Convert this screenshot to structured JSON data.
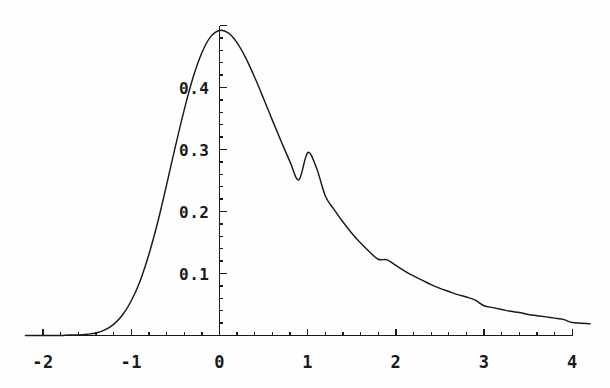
{
  "chart_data": {
    "type": "line",
    "title": "",
    "subtitle": "",
    "xlabel": "",
    "ylabel": "",
    "xlim": [
      -2.2,
      4.2
    ],
    "ylim": [
      0,
      0.54
    ],
    "grid": false,
    "legend": null,
    "annotations": [],
    "axis_style": "cross-axes-at-origin",
    "x_ticks_major": [
      -2,
      -1,
      0,
      1,
      2,
      3,
      4
    ],
    "x_tick_labels": [
      "-2",
      "-1",
      "0",
      "1",
      "2",
      "3",
      "4"
    ],
    "x_minor_ticks_per_major": 5,
    "y_ticks_major": [
      0.1,
      0.2,
      0.3,
      0.4
    ],
    "y_tick_labels": [
      "0.1",
      "0.2",
      "0.3",
      "0.4"
    ],
    "y_minor_ticks_per_major": 5,
    "series": [
      {
        "name": "density",
        "style": "solid-thin",
        "color": "#1a1a1a",
        "x": [
          -2.2,
          -2.1,
          -2.0,
          -1.9,
          -1.8,
          -1.7,
          -1.6,
          -1.5,
          -1.4,
          -1.3,
          -1.2,
          -1.1,
          -1.0,
          -0.9,
          -0.8,
          -0.7,
          -0.6,
          -0.5,
          -0.4,
          -0.3,
          -0.2,
          -0.1,
          0.0,
          0.1,
          0.2,
          0.3,
          0.4,
          0.5,
          0.6,
          0.7,
          0.8,
          0.9,
          1.0,
          1.1,
          1.2,
          1.3,
          1.4,
          1.5,
          1.6,
          1.7,
          1.8,
          1.9,
          2.0,
          2.1,
          2.2,
          2.3,
          2.4,
          2.5,
          2.6,
          2.7,
          2.8,
          2.9,
          3.0,
          3.1,
          3.2,
          3.3,
          3.4,
          3.5,
          3.6,
          3.7,
          3.8,
          3.9,
          4.0,
          4.2
        ],
        "y": [
          0.0,
          0.0,
          0.0,
          0.0,
          0.0,
          0.001,
          0.001,
          0.002,
          0.004,
          0.009,
          0.018,
          0.033,
          0.056,
          0.088,
          0.131,
          0.183,
          0.243,
          0.305,
          0.364,
          0.416,
          0.456,
          0.482,
          0.492,
          0.488,
          0.472,
          0.447,
          0.416,
          0.382,
          0.347,
          0.313,
          0.28,
          0.251,
          0.295,
          0.27,
          0.225,
          0.203,
          0.183,
          0.165,
          0.149,
          0.135,
          0.123,
          0.122,
          0.113,
          0.104,
          0.096,
          0.089,
          0.082,
          0.076,
          0.071,
          0.066,
          0.062,
          0.057,
          0.048,
          0.045,
          0.042,
          0.039,
          0.037,
          0.034,
          0.032,
          0.03,
          0.028,
          0.026,
          0.021,
          0.019
        ]
      }
    ],
    "peak": {
      "x": 0.0,
      "y": 0.494
    }
  },
  "axes": {
    "x_axis_name": "horizontal-axis",
    "y_axis_name": "vertical-axis"
  }
}
